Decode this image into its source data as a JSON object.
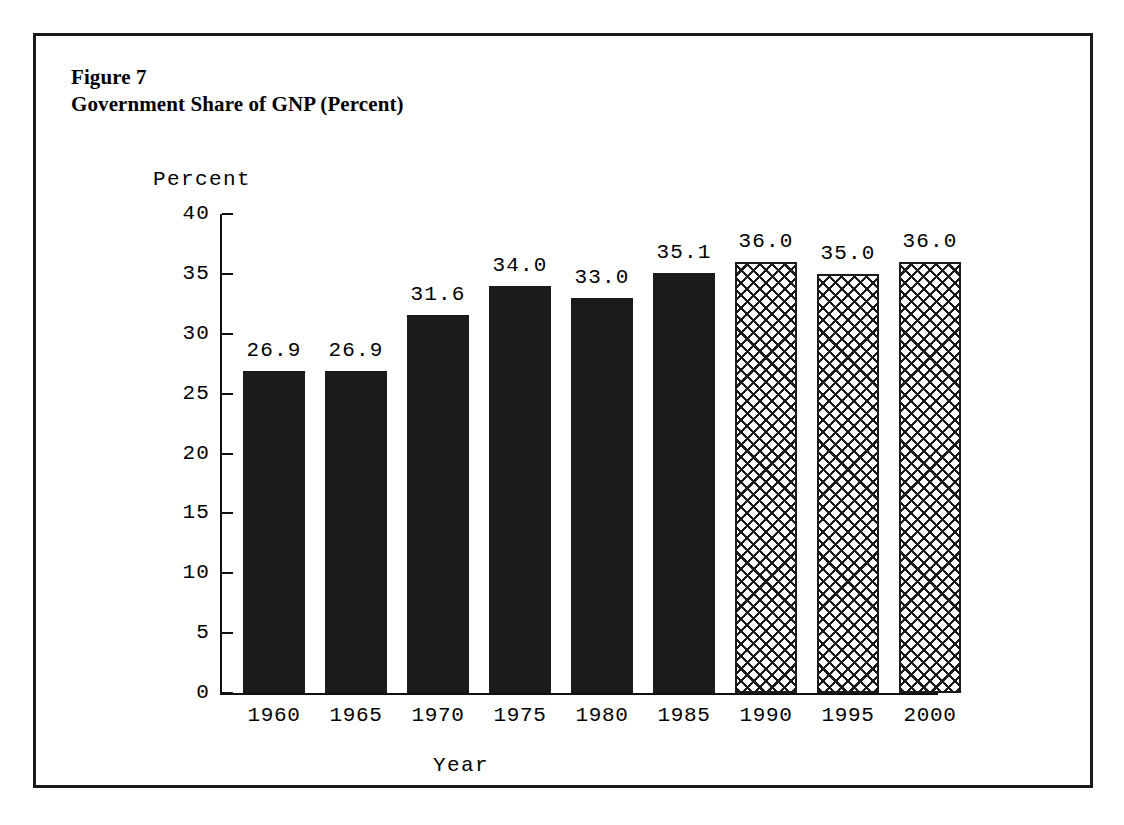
{
  "figure": {
    "title_line1": "Figure 7",
    "title_line2": "Government Share of GNP (Percent)"
  },
  "chart_data": {
    "type": "bar",
    "title": "Government Share of GNP (Percent)",
    "xlabel": "Year",
    "ylabel": "Percent",
    "categories": [
      "1960",
      "1965",
      "1970",
      "1975",
      "1980",
      "1985",
      "1990",
      "1995",
      "2000"
    ],
    "values": [
      26.9,
      26.9,
      31.6,
      34.0,
      33.0,
      35.1,
      36.0,
      35.0,
      36.0
    ],
    "value_labels": [
      "26.9",
      "26.9",
      "31.6",
      "34.0",
      "33.0",
      "35.1",
      "36.0",
      "35.0",
      "36.0"
    ],
    "bar_styles": [
      "solid",
      "solid",
      "solid",
      "solid",
      "solid",
      "solid",
      "hatch",
      "hatch",
      "hatch"
    ],
    "ylim": [
      0,
      40
    ],
    "yticks": [
      0,
      5,
      10,
      15,
      20,
      25,
      30,
      35,
      40
    ],
    "ytick_labels": [
      "0",
      "5",
      "10",
      "15",
      "20",
      "25",
      "30",
      "35",
      "40"
    ],
    "grid": false,
    "legend": null,
    "colors": {
      "bar_solid": "#1b1b1b",
      "bar_hatch_line": "#1b1b1b",
      "bar_hatch_background": "#ffffff",
      "axis": "#111111",
      "text": "#000000",
      "background": "#ffffff",
      "frame": "#1a1a1a"
    }
  }
}
